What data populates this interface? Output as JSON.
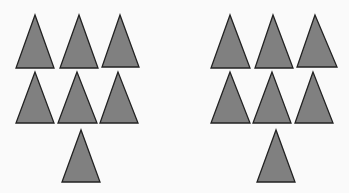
{
  "colors": {
    "background": "#fafafa",
    "triangle_fill": "#808080",
    "triangle_stroke": "#222222"
  },
  "groups": [
    {
      "name": "left-group",
      "count": 7,
      "triangles": [
        {
          "apex": [
            35,
            15
          ],
          "base_left": [
            16,
            68
          ],
          "base_right": [
            54,
            68
          ]
        },
        {
          "apex": [
            79,
            15
          ],
          "base_left": [
            60,
            68
          ],
          "base_right": [
            98,
            68
          ]
        },
        {
          "apex": [
            120,
            15
          ],
          "base_left": [
            102,
            67
          ],
          "base_right": [
            139,
            67
          ]
        },
        {
          "apex": [
            35,
            72
          ],
          "base_left": [
            16,
            123
          ],
          "base_right": [
            54,
            123
          ]
        },
        {
          "apex": [
            77,
            72
          ],
          "base_left": [
            58,
            123
          ],
          "base_right": [
            97,
            123
          ]
        },
        {
          "apex": [
            118,
            72
          ],
          "base_left": [
            100,
            123
          ],
          "base_right": [
            138,
            123
          ]
        },
        {
          "apex": [
            81,
            130
          ],
          "base_left": [
            62,
            182
          ],
          "base_right": [
            100,
            182
          ]
        }
      ]
    },
    {
      "name": "right-group",
      "count": 7,
      "triangles": [
        {
          "apex": [
            230,
            15
          ],
          "base_left": [
            211,
            68
          ],
          "base_right": [
            250,
            68
          ]
        },
        {
          "apex": [
            273,
            15
          ],
          "base_left": [
            255,
            68
          ],
          "base_right": [
            293,
            68
          ]
        },
        {
          "apex": [
            315,
            15
          ],
          "base_left": [
            297,
            67
          ],
          "base_right": [
            337,
            67
          ]
        },
        {
          "apex": [
            230,
            72
          ],
          "base_left": [
            211,
            123
          ],
          "base_right": [
            250,
            123
          ]
        },
        {
          "apex": [
            272,
            72
          ],
          "base_left": [
            253,
            123
          ],
          "base_right": [
            291,
            123
          ]
        },
        {
          "apex": [
            313,
            72
          ],
          "base_left": [
            295,
            123
          ],
          "base_right": [
            333,
            123
          ]
        },
        {
          "apex": [
            276,
            130
          ],
          "base_left": [
            257,
            182
          ],
          "base_right": [
            295,
            182
          ]
        }
      ]
    }
  ]
}
